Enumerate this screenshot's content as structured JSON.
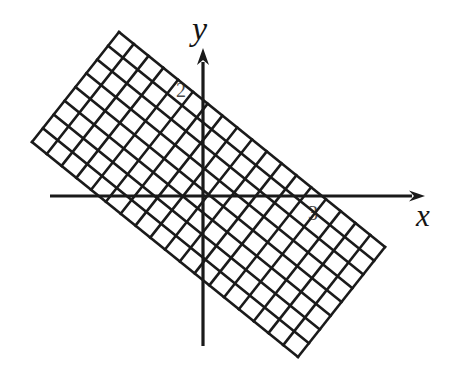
{
  "figure": {
    "title": "",
    "background_color": "#ffffff",
    "ink_color": "#1a1a1a",
    "width": 459,
    "height": 384
  },
  "axes": {
    "x": {
      "label": "x",
      "label_position": {
        "x": 425,
        "y": 216
      },
      "line": {
        "x1": 50,
        "y1": 196,
        "x2": 412,
        "y2": 196
      },
      "arrow": "right",
      "stroke_width": 3.2
    },
    "y": {
      "label": "y",
      "label_position": {
        "x": 205,
        "y": 30
      },
      "line": {
        "x1": 203,
        "y1": 62,
        "x2": 203,
        "y2": 346
      },
      "arrow": "up",
      "stroke_width": 3.2
    },
    "origin": {
      "x": 203,
      "y": 197
    }
  },
  "tick_labels": [
    {
      "name": "y-axis-tick-2",
      "text": "2",
      "x": 183,
      "y": 90,
      "axis": "y"
    },
    {
      "name": "x-axis-tick-3",
      "text": "3",
      "x": 315,
      "y": 213,
      "axis": "x"
    }
  ],
  "chart_data": {
    "type": "scatter",
    "title": "",
    "xlabel": "x",
    "ylabel": "y",
    "grid": true,
    "legend": null,
    "annotations": [
      "2",
      "3"
    ],
    "lattice": {
      "rotation_degrees": -37,
      "cell_size_px": 18.6,
      "line_stroke_width": 2.6,
      "patch_corners": [
        {
          "name": "top",
          "x": 119,
          "y": 32
        },
        {
          "name": "left",
          "x": 32,
          "y": 142
        },
        {
          "name": "bottom",
          "x": 296,
          "y": 364
        },
        {
          "name": "right",
          "x": 385,
          "y": 247
        }
      ],
      "u_steps": 15,
      "v_steps": 8
    },
    "xlim": [
      -8.2,
      11.2
    ],
    "ylim": [
      -7.9,
      7.3
    ]
  }
}
